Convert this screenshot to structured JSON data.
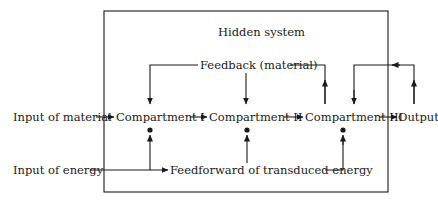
{
  "diagram": {
    "container": {
      "label": "Hidden system"
    },
    "inputs": {
      "material": "Input of material",
      "energy": "Input of energy"
    },
    "compartments": [
      {
        "label": "Compartment I"
      },
      {
        "label": "Compartment II"
      },
      {
        "label": "Compartment III"
      }
    ],
    "output": "Output",
    "feedback": "Feedback (material)",
    "feedforward": "Feedforward of transduced energy",
    "colors": {
      "line": "#1a1a1a",
      "background": "#ffffff"
    }
  }
}
